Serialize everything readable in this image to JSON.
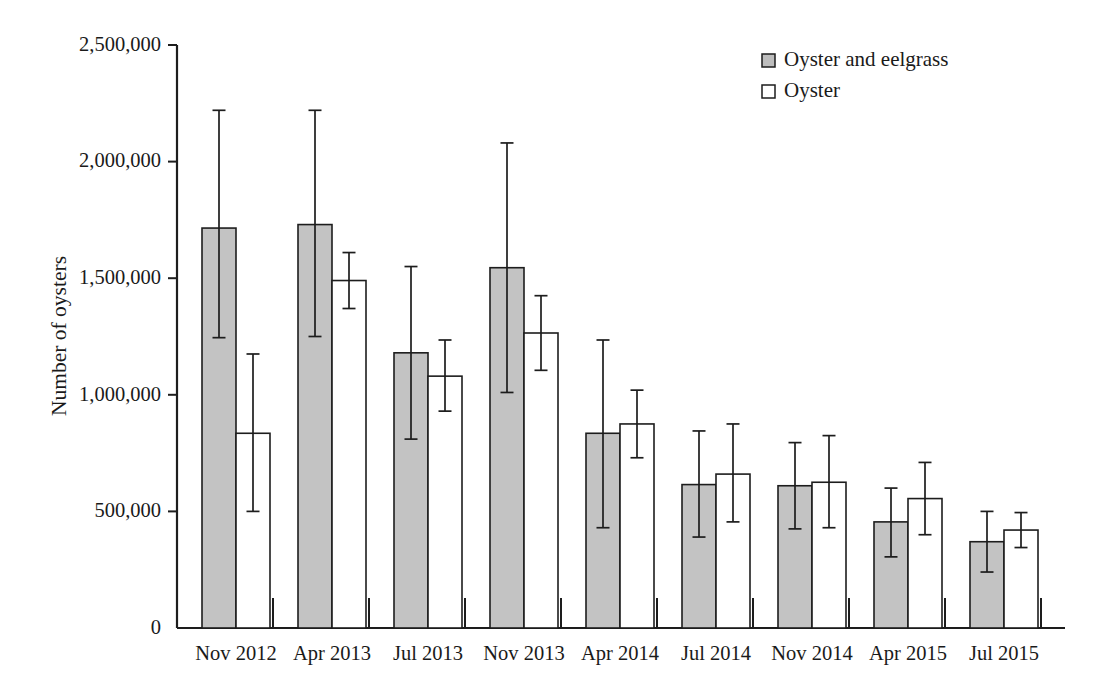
{
  "chart_data": {
    "type": "bar",
    "title": "",
    "subtitle": "",
    "xlabel": "",
    "ylabel": "Number of oysters",
    "ylim": [
      0,
      2500000
    ],
    "ytick_labels": [
      "0",
      "500,000",
      "1,000,000",
      "1,500,000",
      "2,000,000",
      "2,500,000"
    ],
    "ytick_values": [
      0,
      500000,
      1000000,
      1500000,
      2000000,
      2500000
    ],
    "grid": false,
    "legend_position": "top-right",
    "error_bar_style": "symmetric-capped",
    "categories": [
      "Nov 2012",
      "Apr 2013",
      "Jul 2013",
      "Nov 2013",
      "Apr 2014",
      "Jul 2014",
      "Nov 2014",
      "Apr 2015",
      "Jul 2015"
    ],
    "series": [
      {
        "name": "Oyster and eelgrass",
        "color": "#c3c3c3",
        "values": [
          1715000,
          1730000,
          1180000,
          1545000,
          835000,
          615000,
          610000,
          455000,
          370000
        ],
        "err_low": [
          1245000,
          1250000,
          810000,
          1010000,
          430000,
          390000,
          425000,
          305000,
          240000
        ],
        "err_high": [
          2220000,
          2220000,
          1550000,
          2080000,
          1235000,
          845000,
          795000,
          600000,
          500000
        ]
      },
      {
        "name": "Oyster",
        "color": "#ffffff",
        "values": [
          835000,
          1490000,
          1080000,
          1265000,
          875000,
          660000,
          625000,
          555000,
          420000
        ],
        "err_low": [
          500000,
          1370000,
          930000,
          1105000,
          730000,
          455000,
          430000,
          400000,
          345000
        ],
        "err_high": [
          1175000,
          1610000,
          1235000,
          1425000,
          1020000,
          875000,
          825000,
          710000,
          495000
        ]
      }
    ]
  },
  "legend": {
    "items": [
      {
        "label": "Oyster and eelgrass",
        "swatch": "filled-gray-square"
      },
      {
        "label": "Oyster",
        "swatch": "open-white-square"
      }
    ]
  },
  "colors": {
    "bar_fill_gray": "#c3c3c3",
    "bar_fill_white": "#ffffff",
    "stroke": "#1d1d1d",
    "background": "#ffffff"
  }
}
